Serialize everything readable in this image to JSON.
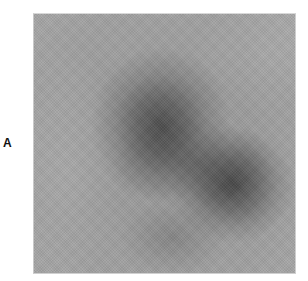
{
  "figure": {
    "panel_label": "A",
    "image": {
      "description": "grayscale scan image with two dark diffuse regions",
      "colors": {
        "background_gray": "#9c9c9c",
        "dark_region": "#2a2a2a",
        "page_background": "#ffffff",
        "label_color": "#111111"
      }
    }
  }
}
